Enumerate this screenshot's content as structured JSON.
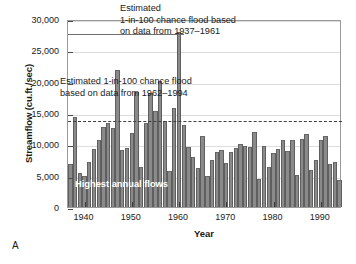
{
  "panel": {
    "letter": "A"
  },
  "chart_data": {
    "type": "bar",
    "title": "",
    "xlabel": "Year",
    "ylabel": "Streamflow (cu.ft./sec)",
    "xlim": [
      1936.5,
      1994.5
    ],
    "ylim": [
      0,
      30000
    ],
    "ytick_values": [
      0,
      5000,
      10000,
      15000,
      20000,
      25000,
      30000
    ],
    "ytick_labels": [
      "0",
      "5,000",
      "10,000",
      "15,000",
      "20,000",
      "25,000",
      "30,000"
    ],
    "xtick_values": [
      1940,
      1950,
      1960,
      1970,
      1980,
      1990
    ],
    "xtick_labels": [
      "1940",
      "1950",
      "1960",
      "1970",
      "1980",
      "1990"
    ],
    "grid": true,
    "legend": "none",
    "bar_color": "#8a8a8a",
    "bar_edge_color": "#5f5f5f",
    "series_name": "Highest annual flows",
    "x": [
      1937,
      1938,
      1939,
      1940,
      1941,
      1942,
      1943,
      1944,
      1945,
      1946,
      1947,
      1948,
      1949,
      1950,
      1951,
      1952,
      1953,
      1954,
      1955,
      1956,
      1957,
      1958,
      1959,
      1960,
      1961,
      1962,
      1963,
      1964,
      1965,
      1966,
      1967,
      1968,
      1969,
      1970,
      1971,
      1972,
      1973,
      1974,
      1975,
      1976,
      1977,
      1978,
      1979,
      1980,
      1981,
      1982,
      1983,
      1984,
      1985,
      1986,
      1987,
      1988,
      1989,
      1990,
      1991,
      1992,
      1993,
      1994
    ],
    "values": [
      6800,
      14300,
      5400,
      4950,
      7250,
      9200,
      10700,
      12700,
      13450,
      12650,
      21900,
      9050,
      9400,
      11800,
      18300,
      6400,
      13400,
      18150,
      15350,
      20100,
      13800,
      5750,
      15750,
      28000,
      13050,
      9550,
      8050,
      6300,
      11350,
      4950,
      7500,
      8800,
      9150,
      7000,
      8700,
      9400,
      10100,
      9800,
      9600,
      12050,
      4450,
      9800,
      6400,
      8550,
      9200,
      10650,
      8950,
      10700,
      5150,
      10800,
      11650,
      5900,
      7450,
      10750,
      11400,
      6900,
      7200,
      4250
    ],
    "annotations": [
      {
        "name": "flood-threshold-1937-1961",
        "text": "Estimated\n1-in-100 chance flood based\non data from 1937–1961",
        "line_value": 28000,
        "line_style": "solid",
        "line_x_start": 1936.5,
        "line_x_end": 1961
      },
      {
        "name": "flood-threshold-1962-1994",
        "text": "Estimated 1-in-100 chance flood\nbased on data from 1962–1994",
        "line_value": 14000,
        "line_style": "dashed",
        "line_x_start": 1936.5,
        "line_x_end": 1994.5
      }
    ],
    "inner_label": "Highest annual flows"
  }
}
